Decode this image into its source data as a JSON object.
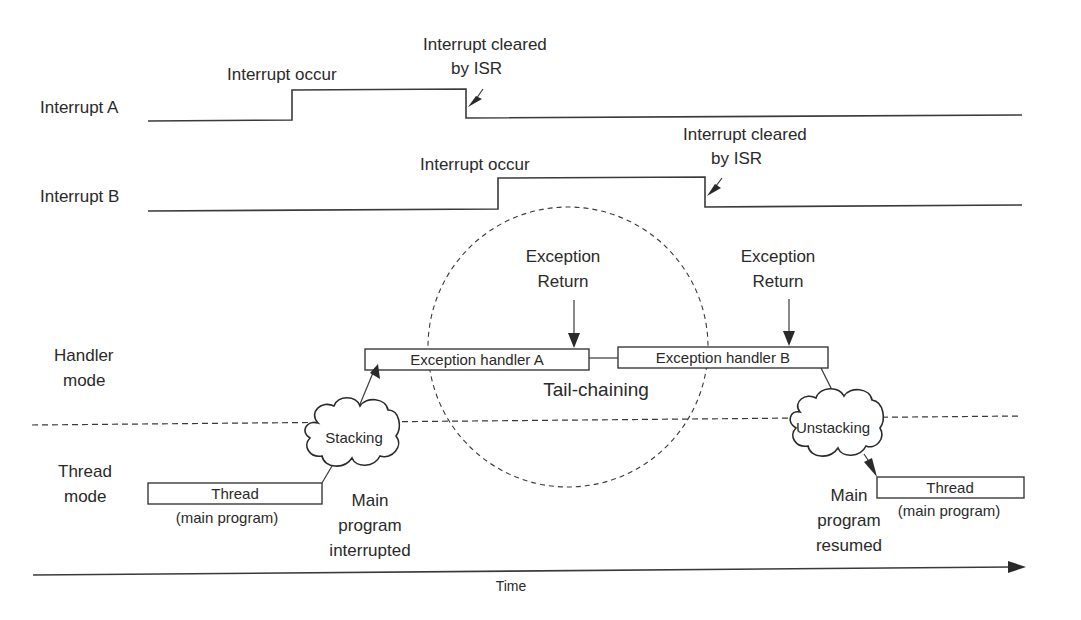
{
  "signals": {
    "interrupt_a": {
      "label": "Interrupt A",
      "occur_label": "Interrupt occur",
      "cleared_label_line1": "Interrupt cleared",
      "cleared_label_line2": "by ISR"
    },
    "interrupt_b": {
      "label": "Interrupt B",
      "occur_label": "Interrupt occur",
      "cleared_label_line1": "Interrupt cleared",
      "cleared_label_line2": "by ISR"
    }
  },
  "modes": {
    "handler_line1": "Handler",
    "handler_line2": "mode",
    "thread_line1": "Thread",
    "thread_line2": "mode"
  },
  "handlers": {
    "a_label": "Exception handler A",
    "b_label": "Exception handler B",
    "exception_return_a_line1": "Exception",
    "exception_return_a_line2": "Return",
    "exception_return_b_line1": "Exception",
    "exception_return_b_line2": "Return",
    "tail_chaining_label": "Tail-chaining"
  },
  "clouds": {
    "stacking_label": "Stacking",
    "unstacking_label": "Unstacking"
  },
  "threads": {
    "left_label": "Thread",
    "left_sub": "(main program)",
    "right_label": "Thread",
    "right_sub": "(main program)"
  },
  "annotations": {
    "interrupted_line1": "Main",
    "interrupted_line2": "program",
    "interrupted_line3": "interrupted",
    "resumed_line1": "Main",
    "resumed_line2": "program",
    "resumed_line3": "resumed"
  },
  "axis": {
    "time_label": "Time"
  }
}
